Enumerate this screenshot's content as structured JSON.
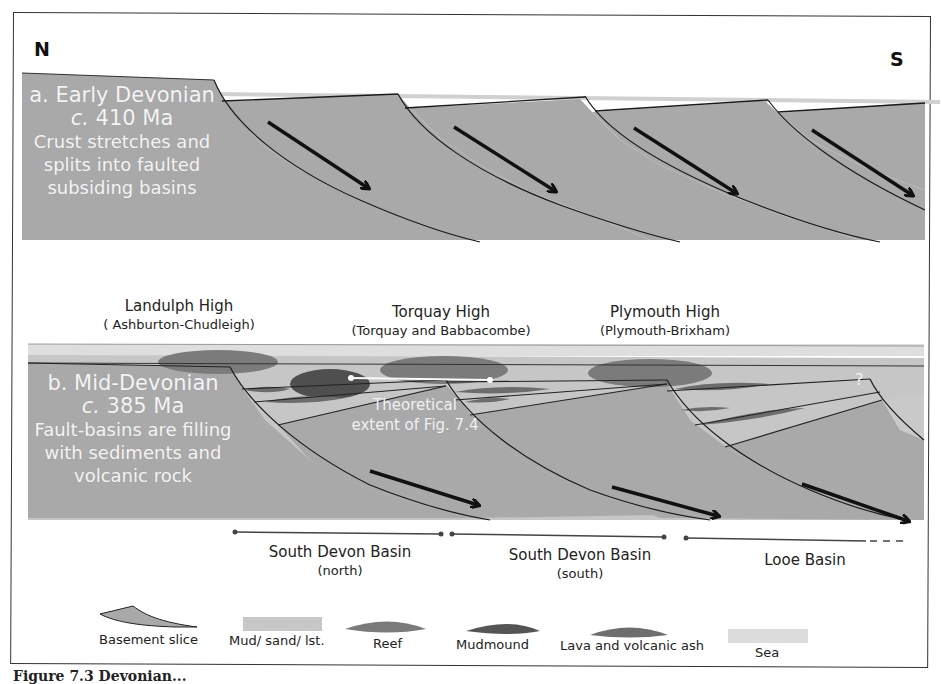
{
  "compass": {
    "north": "N",
    "south": "S"
  },
  "panel_a": {
    "title": "a. Early Devonian",
    "age_prefix": "c.",
    "age": "410 Ma",
    "description_lines": [
      "Crust stretches and",
      "splits into faulted",
      "subsiding basins"
    ]
  },
  "panel_b": {
    "title": "b. Mid-Devonian",
    "age_prefix": "c.",
    "age": "385 Ma",
    "description_lines": [
      "Fault-basins  are filling",
      "with sediments and",
      "volcanic rock"
    ],
    "highs": [
      {
        "name": "Landulph High",
        "sub": "( Ashburton-Chudleigh)"
      },
      {
        "name": "Torquay High",
        "sub": "(Torquay and Babbacombe)"
      },
      {
        "name": "Plymouth High",
        "sub": "(Plymouth-Brixham)"
      }
    ],
    "overlay": {
      "line1": "Theoretical",
      "line2": "extent of Fig. 7.4"
    },
    "uncertain_mark": "?",
    "basins": [
      {
        "name": "South Devon Basin",
        "sub": "(north)"
      },
      {
        "name": "South Devon Basin",
        "sub": "(south)"
      },
      {
        "name": "Looe Basin",
        "sub": ""
      }
    ]
  },
  "legend": {
    "items": [
      {
        "label": "Basement slice",
        "symbol": "basement-slice-swatch",
        "color": "#a9a9a9"
      },
      {
        "label": "Mud/ sand/ lst.",
        "symbol": "sediment-swatch",
        "color": "#c8c8c8"
      },
      {
        "label": "Reef",
        "symbol": "reef-swatch",
        "color": "#7a7a7a"
      },
      {
        "label": "Mudmound",
        "symbol": "mudmound-swatch",
        "color": "#555555"
      },
      {
        "label": "Lava and volcanic ash",
        "symbol": "lava-swatch",
        "color": "#6e6e6e"
      },
      {
        "label": "Sea",
        "symbol": "sea-swatch",
        "color": "#dcdcdc"
      }
    ]
  },
  "caption": {
    "text": "Figure 7.3 Devonian..."
  },
  "colors": {
    "basement": "#a9a9a9",
    "sediment": "#c6c6c6",
    "sea": "#dedede",
    "reef": "#7b7b7b",
    "mudmound": "#555555",
    "lava": "#6c6c6c",
    "line": "#1a1a1a"
  }
}
